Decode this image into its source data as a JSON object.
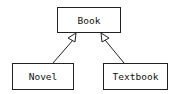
{
  "diagram": {
    "type": "uml-class-inheritance",
    "nodes": [
      {
        "id": "book",
        "label": "Book"
      },
      {
        "id": "novel",
        "label": "Novel"
      },
      {
        "id": "textbook",
        "label": "Textbook"
      }
    ],
    "edges": [
      {
        "from": "novel",
        "to": "book",
        "kind": "generalization"
      },
      {
        "from": "textbook",
        "to": "book",
        "kind": "generalization"
      }
    ],
    "colors": {
      "stroke": "#222222",
      "background": "#ffffff"
    }
  }
}
